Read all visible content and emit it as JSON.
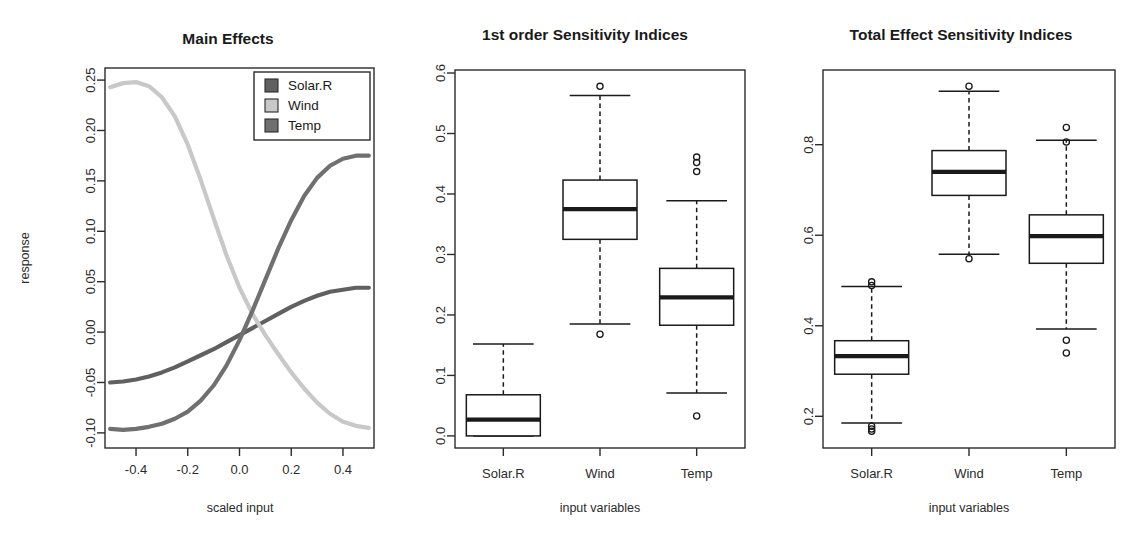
{
  "figure": {
    "background": "#ffffff",
    "ink": "#1a1a1a"
  },
  "series_colors": {
    "Solar.R": "#606060",
    "Wind": "#c8c8c8",
    "Temp": "#707070"
  },
  "panels": {
    "main_effects": {
      "title": "Main Effects",
      "xlabel": "scaled input",
      "ylabel": "response",
      "xticks": [
        "-0.4",
        "-0.2",
        "0.0",
        "0.2",
        "0.4"
      ],
      "yticks": [
        "-0.10",
        "-0.05",
        "0.00",
        "0.05",
        "0.10",
        "0.15",
        "0.20",
        "0.25"
      ],
      "legend": [
        {
          "label": "Solar.R",
          "color": "#606060"
        },
        {
          "label": "Wind",
          "color": "#c8c8c8"
        },
        {
          "label": "Temp",
          "color": "#707070"
        }
      ]
    },
    "first_order": {
      "title": "1st order Sensitivity Indices",
      "xlabel": "input variables",
      "categories": [
        "Solar.R",
        "Wind",
        "Temp"
      ],
      "yticks": [
        "0.0",
        "0.1",
        "0.2",
        "0.3",
        "0.4",
        "0.5",
        "0.6"
      ]
    },
    "total_effect": {
      "title": "Total Effect Sensitivity Indices",
      "xlabel": "input variables",
      "categories": [
        "Solar.R",
        "Wind",
        "Temp"
      ],
      "yticks": [
        "0.2",
        "0.4",
        "0.6",
        "0.8"
      ]
    }
  },
  "chart_data": [
    {
      "type": "line",
      "id": "main-effects",
      "title": "Main Effects",
      "xlabel": "scaled input",
      "ylabel": "response",
      "xlim": [
        -0.52,
        0.52
      ],
      "ylim": [
        -0.115,
        0.262
      ],
      "grid": false,
      "legend_position": "top-right",
      "legend_entries": [
        "Solar.R",
        "Wind",
        "Temp"
      ],
      "x": [
        -0.5,
        -0.45,
        -0.4,
        -0.35,
        -0.3,
        -0.25,
        -0.2,
        -0.15,
        -0.1,
        -0.05,
        0.0,
        0.05,
        0.1,
        0.15,
        0.2,
        0.25,
        0.3,
        0.35,
        0.4,
        0.45,
        0.5
      ],
      "series": [
        {
          "name": "Solar.R",
          "color": "#606060",
          "values": [
            -0.05,
            -0.049,
            -0.047,
            -0.044,
            -0.04,
            -0.035,
            -0.029,
            -0.023,
            -0.017,
            -0.01,
            -0.003,
            0.004,
            0.011,
            0.018,
            0.025,
            0.031,
            0.036,
            0.04,
            0.042,
            0.044,
            0.044
          ]
        },
        {
          "name": "Wind",
          "color": "#c8c8c8",
          "values": [
            0.243,
            0.247,
            0.248,
            0.244,
            0.233,
            0.214,
            0.186,
            0.151,
            0.113,
            0.076,
            0.044,
            0.018,
            -0.003,
            -0.022,
            -0.04,
            -0.056,
            -0.07,
            -0.081,
            -0.089,
            -0.093,
            -0.095
          ]
        },
        {
          "name": "Temp",
          "color": "#707070",
          "values": [
            -0.096,
            -0.097,
            -0.096,
            -0.094,
            -0.091,
            -0.086,
            -0.079,
            -0.068,
            -0.053,
            -0.033,
            -0.008,
            0.021,
            0.052,
            0.083,
            0.111,
            0.135,
            0.153,
            0.165,
            0.172,
            0.175,
            0.175
          ]
        }
      ]
    },
    {
      "type": "boxplot",
      "id": "first-order-sensitivity",
      "title": "1st order Sensitivity Indices",
      "xlabel": "input variables",
      "ylabel": "",
      "ylim": [
        -0.02,
        0.605
      ],
      "categories": [
        "Solar.R",
        "Wind",
        "Temp"
      ],
      "boxes": [
        {
          "name": "Solar.R",
          "lower_whisker": 0.0,
          "q1": 0.0,
          "median": 0.027,
          "q3": 0.068,
          "upper_whisker": 0.152,
          "outliers": []
        },
        {
          "name": "Wind",
          "lower_whisker": 0.185,
          "q1": 0.325,
          "median": 0.375,
          "q3": 0.423,
          "upper_whisker": 0.563,
          "outliers": [
            0.578,
            0.168
          ]
        },
        {
          "name": "Temp",
          "lower_whisker": 0.071,
          "q1": 0.183,
          "median": 0.229,
          "q3": 0.277,
          "upper_whisker": 0.389,
          "outliers": [
            0.461,
            0.452,
            0.437,
            0.033
          ]
        }
      ]
    },
    {
      "type": "boxplot",
      "id": "total-effect-sensitivity",
      "title": "Total Effect Sensitivity Indices",
      "xlabel": "input variables",
      "ylabel": "",
      "ylim": [
        0.13,
        0.965
      ],
      "categories": [
        "Solar.R",
        "Wind",
        "Temp"
      ],
      "boxes": [
        {
          "name": "Solar.R",
          "lower_whisker": 0.185,
          "q1": 0.293,
          "median": 0.333,
          "q3": 0.367,
          "upper_whisker": 0.487,
          "outliers": [
            0.497,
            0.489,
            0.178,
            0.172,
            0.167
          ]
        },
        {
          "name": "Wind",
          "lower_whisker": 0.558,
          "q1": 0.688,
          "median": 0.74,
          "q3": 0.787,
          "upper_whisker": 0.918,
          "outliers": [
            0.929,
            0.548
          ]
        },
        {
          "name": "Temp",
          "lower_whisker": 0.393,
          "q1": 0.538,
          "median": 0.598,
          "q3": 0.645,
          "upper_whisker": 0.81,
          "outliers": [
            0.838,
            0.806,
            0.368,
            0.34
          ]
        }
      ]
    }
  ]
}
